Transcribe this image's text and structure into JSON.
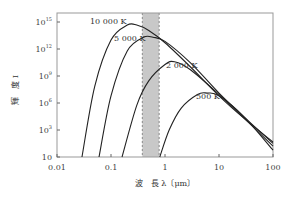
{
  "chart_data": {
    "type": "line",
    "title": "",
    "xlabel": "波　長 λ〔μm〕",
    "ylabel": "輝　度 I",
    "xscale": "log",
    "yscale": "log",
    "xlim": [
      0.01,
      100
    ],
    "x_ticks": [
      "0.01",
      "0.1",
      "1",
      "10",
      "100"
    ],
    "y_ticks": [
      {
        "base": "10",
        "exp": ""
      },
      {
        "base": "10",
        "exp": "3"
      },
      {
        "base": "10",
        "exp": "6"
      },
      {
        "base": "10",
        "exp": "9"
      },
      {
        "base": "10",
        "exp": "12"
      },
      {
        "base": "10",
        "exp": "15"
      }
    ],
    "shaded_band": {
      "x_from": 0.38,
      "x_to": 0.78,
      "color": "#c8c8c8"
    },
    "series": [
      {
        "name": "10 000 K",
        "label": "10 000 K",
        "x": [
          0.029,
          0.05,
          0.1,
          0.2,
          0.3,
          0.5,
          1,
          3,
          10,
          30,
          100
        ],
        "y_level": [
          0,
          0.52,
          0.86,
          0.97,
          0.97,
          0.93,
          0.84,
          0.66,
          0.45,
          0.28,
          0.11
        ]
      },
      {
        "name": "5 000 K",
        "label": "5 000 K",
        "x": [
          0.06,
          0.1,
          0.2,
          0.4,
          0.6,
          1,
          3,
          10,
          30,
          100
        ],
        "y_level": [
          0,
          0.45,
          0.78,
          0.88,
          0.88,
          0.85,
          0.69,
          0.47,
          0.29,
          0.1
        ]
      },
      {
        "name": "2 000 K",
        "label": "2 000 K",
        "x": [
          0.16,
          0.3,
          0.5,
          1,
          1.5,
          3,
          10,
          30,
          100
        ],
        "y_level": [
          0,
          0.38,
          0.56,
          0.68,
          0.7,
          0.64,
          0.46,
          0.28,
          0.08
        ]
      },
      {
        "name": "500 K",
        "label": "500 K",
        "x": [
          0.8,
          1.2,
          2,
          4,
          6,
          10,
          30,
          100
        ],
        "y_level": [
          0,
          0.2,
          0.36,
          0.46,
          0.47,
          0.45,
          0.29,
          0.05
        ]
      }
    ],
    "grid": false,
    "legend": "inline labels"
  }
}
